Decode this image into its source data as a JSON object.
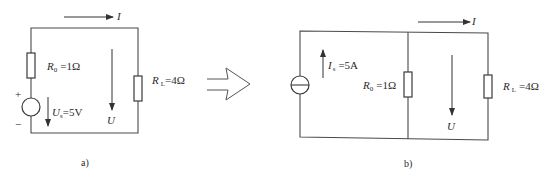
{
  "circuit_a": {
    "caption": "a)",
    "current_label": "I",
    "voltage_label": "U",
    "source": {
      "type": "voltage-source",
      "symbol": "U",
      "subscript": "s",
      "value_text": "=5V",
      "plus": "+",
      "minus": "−"
    },
    "r0": {
      "symbol": "R",
      "subscript": "0",
      "value_text": "=1Ω"
    },
    "rl": {
      "symbol": "R",
      "subscript": "L",
      "value_text": "=4Ω"
    }
  },
  "transform_arrow": {
    "icon": "hollow-right-arrow"
  },
  "circuit_b": {
    "caption": "b)",
    "current_label": "I",
    "voltage_label": "U",
    "source": {
      "type": "current-source",
      "symbol": "I",
      "subscript": "s",
      "value_text": "=5A"
    },
    "r0": {
      "symbol": "R",
      "subscript": "0",
      "value_text": "=1Ω"
    },
    "rl": {
      "symbol": "R",
      "subscript": "L",
      "value_text": "=4Ω"
    }
  },
  "colors": {
    "line": "#4a4a4a",
    "text": "#2a2a2a",
    "background": "#ffffff"
  }
}
